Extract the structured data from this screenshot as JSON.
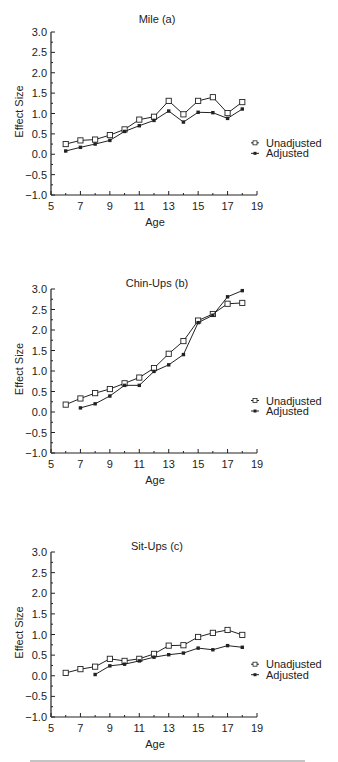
{
  "chart_data": [
    {
      "type": "line",
      "title": "Mile (a)",
      "xlabel": "Age",
      "ylabel": "Effect Size",
      "xlim": [
        5,
        19
      ],
      "ylim": [
        -1.0,
        3.0
      ],
      "xticks": [
        5,
        7,
        9,
        11,
        13,
        15,
        17,
        19
      ],
      "yticks": [
        "3.0",
        "2.5",
        "2.0",
        "1.5",
        "1.0",
        "0.5",
        "0.0",
        "-0.5",
        "-1.0"
      ],
      "grid": false,
      "legend_position": "right",
      "series": [
        {
          "name": "Unadjusted",
          "marker": "open-square",
          "x": [
            6,
            7,
            8,
            9,
            10,
            11,
            12,
            13,
            14,
            15,
            16,
            17,
            18
          ],
          "values": [
            0.25,
            0.34,
            0.36,
            0.47,
            0.61,
            0.85,
            0.92,
            1.31,
            0.98,
            1.31,
            1.4,
            1.01,
            1.28
          ]
        },
        {
          "name": "Adjusted",
          "marker": "filled-square",
          "x": [
            6,
            7,
            8,
            9,
            10,
            11,
            12,
            13,
            14,
            15,
            16,
            17,
            18
          ],
          "values": [
            0.08,
            0.17,
            0.25,
            0.34,
            0.56,
            0.7,
            0.83,
            1.06,
            0.79,
            1.03,
            1.02,
            0.88,
            1.11
          ]
        }
      ]
    },
    {
      "type": "line",
      "title": "Chin-Ups (b)",
      "xlabel": "Age",
      "ylabel": "Effect Size",
      "xlim": [
        5,
        19
      ],
      "ylim": [
        -1.0,
        3.0
      ],
      "xticks": [
        5,
        7,
        9,
        11,
        13,
        15,
        17,
        19
      ],
      "yticks": [
        "3.0",
        "2.5",
        "2.0",
        "1.5",
        "1.0",
        "0.5",
        "0.0",
        "-0.5",
        "-1.0"
      ],
      "grid": false,
      "legend_position": "right",
      "series": [
        {
          "name": "Unadjusted",
          "marker": "open-square",
          "x": [
            6,
            7,
            8,
            9,
            10,
            11,
            12,
            13,
            14,
            15,
            16,
            17,
            18
          ],
          "values": [
            0.18,
            0.33,
            0.46,
            0.56,
            0.7,
            0.84,
            1.07,
            1.42,
            1.73,
            2.23,
            2.39,
            2.64,
            2.66
          ]
        },
        {
          "name": "Adjusted",
          "marker": "filled-square",
          "x": [
            7,
            8,
            9,
            10,
            11,
            12,
            13,
            14,
            15,
            16,
            17,
            18
          ],
          "values": [
            0.1,
            0.2,
            0.39,
            0.65,
            0.65,
            0.99,
            1.15,
            1.4,
            2.18,
            2.36,
            2.81,
            2.96
          ]
        }
      ]
    },
    {
      "type": "line",
      "title": "Sit-Ups (c)",
      "xlabel": "Age",
      "ylabel": "Effect Size",
      "xlim": [
        5,
        19
      ],
      "ylim": [
        -1.0,
        3.0
      ],
      "xticks": [
        5,
        7,
        9,
        11,
        13,
        15,
        17,
        19
      ],
      "yticks": [
        "3.0",
        "2.5",
        "2.0",
        "1.5",
        "1.0",
        "0.5",
        "0.0",
        "-0.5",
        "-1.0"
      ],
      "grid": false,
      "legend_position": "right",
      "series": [
        {
          "name": "Unadjusted",
          "marker": "open-square",
          "x": [
            6,
            7,
            8,
            9,
            10,
            11,
            12,
            13,
            14,
            15,
            16,
            17,
            18
          ],
          "values": [
            0.07,
            0.16,
            0.22,
            0.41,
            0.36,
            0.41,
            0.53,
            0.73,
            0.74,
            0.94,
            1.04,
            1.11,
            0.99
          ]
        },
        {
          "name": "Adjusted",
          "marker": "filled-square",
          "x": [
            8,
            9,
            10,
            11,
            12,
            13,
            14,
            15,
            16,
            17,
            18
          ],
          "values": [
            0.03,
            0.24,
            0.28,
            0.36,
            0.45,
            0.51,
            0.55,
            0.67,
            0.63,
            0.73,
            0.69
          ]
        }
      ]
    }
  ],
  "layout": {
    "panels": [
      {
        "top": 32,
        "bottom": 195,
        "title_y": 23
      },
      {
        "top": 289,
        "bottom": 453,
        "title_y": 287
      },
      {
        "top": 552,
        "bottom": 717,
        "title_y": 550
      }
    ],
    "x_left": 51,
    "x_right": 257,
    "line_color": "#222222"
  }
}
